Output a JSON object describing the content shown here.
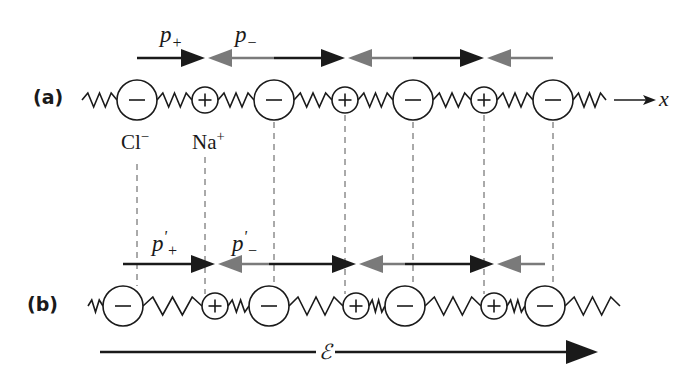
{
  "panels": {
    "a": {
      "label": "(a)",
      "axis_label": "x",
      "ion_labels": {
        "anion": "Cl",
        "anion_sup": "−",
        "cation": "Na",
        "cation_sup": "+"
      },
      "dipole_labels": {
        "plus": "p",
        "plus_sub": "+",
        "minus": "p",
        "minus_sub": "−"
      },
      "ions": [
        {
          "type": "anion",
          "symbol": "−",
          "x": 137
        },
        {
          "type": "cation",
          "symbol": "+",
          "x": 205
        },
        {
          "type": "anion",
          "symbol": "−",
          "x": 274
        },
        {
          "type": "cation",
          "symbol": "+",
          "x": 345
        },
        {
          "type": "anion",
          "symbol": "−",
          "x": 413
        },
        {
          "type": "cation",
          "symbol": "+",
          "x": 484
        },
        {
          "type": "anion",
          "symbol": "−",
          "x": 553
        }
      ]
    },
    "b": {
      "label": "(b)",
      "dipole_labels": {
        "plus": "p",
        "plus_prime": "'",
        "plus_sub": "+",
        "minus": "p",
        "minus_prime": "'",
        "minus_sub": "−"
      },
      "field_label": "ℰ",
      "ions": [
        {
          "type": "anion",
          "symbol": "−",
          "x": 123
        },
        {
          "type": "cation",
          "symbol": "+",
          "x": 215
        },
        {
          "type": "anion",
          "symbol": "−",
          "x": 269
        },
        {
          "type": "cation",
          "symbol": "+",
          "x": 356
        },
        {
          "type": "anion",
          "symbol": "−",
          "x": 405
        },
        {
          "type": "cation",
          "symbol": "+",
          "x": 494
        },
        {
          "type": "anion",
          "symbol": "−",
          "x": 545
        }
      ]
    }
  },
  "colors": {
    "ink": "#1a1a1a",
    "gray_arrow": "#7a7a7a",
    "dashed": "#555555"
  }
}
